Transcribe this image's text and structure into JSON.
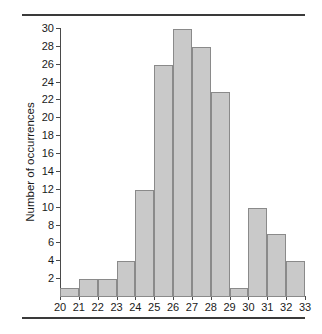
{
  "chart_data": {
    "type": "bar",
    "title": "",
    "subtitle": "",
    "xlabel": "",
    "ylabel": "Number of occurrences",
    "bin_edges": [
      20,
      21,
      22,
      23,
      24,
      25,
      26,
      27,
      28,
      29,
      30,
      31,
      32,
      33
    ],
    "categories": [
      "20-21",
      "21-22",
      "22-23",
      "23-24",
      "24-25",
      "25-26",
      "26-27",
      "27-28",
      "28-29",
      "29-30",
      "30-31",
      "31-32",
      "32-33"
    ],
    "values": [
      1,
      2,
      2,
      4,
      12,
      26,
      30,
      28,
      23,
      1,
      10,
      7,
      4
    ],
    "xtick_labels": [
      "20",
      "21",
      "22",
      "23",
      "24",
      "25",
      "26",
      "27",
      "28",
      "29",
      "30",
      "31",
      "32",
      "33"
    ],
    "ytick_labels": [
      "2",
      "4",
      "6",
      "8",
      "10",
      "12",
      "14",
      "16",
      "18",
      "20",
      "22",
      "24",
      "26",
      "28",
      "30"
    ],
    "ytick_values": [
      2,
      4,
      6,
      8,
      10,
      12,
      14,
      16,
      18,
      20,
      22,
      24,
      26,
      28,
      30
    ],
    "ylim": [
      0,
      30
    ],
    "xlim": [
      20,
      33
    ],
    "grid": false,
    "legend": null,
    "bar_fill_color": "#c9c9c9",
    "bar_edge_color": "#8a8a8a",
    "axis_color": "#4a4a4a",
    "rule_color": "#3a3a3a",
    "background_color": "#ffffff"
  },
  "caption": {
    "label": "",
    "text": ""
  }
}
